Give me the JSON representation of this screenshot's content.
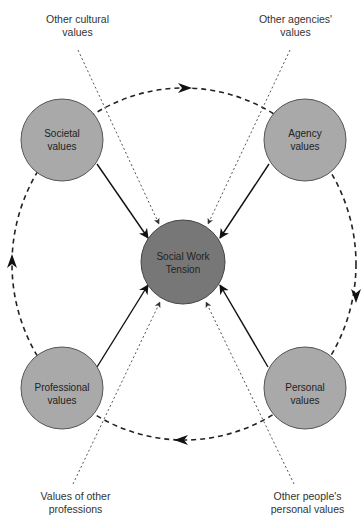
{
  "diagram": {
    "center_node": {
      "line1": "Social Work",
      "line2": "Tension",
      "fill": "#777777"
    },
    "nodes": [
      {
        "id": "societal",
        "line1": "Societal",
        "line2": "values",
        "fill": "#a9a9a9"
      },
      {
        "id": "agency",
        "line1": "Agency",
        "line2": "values",
        "fill": "#a9a9a9"
      },
      {
        "id": "professional",
        "line1": "Professional",
        "line2": "values",
        "fill": "#a9a9a9"
      },
      {
        "id": "personal",
        "line1": "Personal",
        "line2": "values",
        "fill": "#a9a9a9"
      }
    ],
    "external_influences": [
      {
        "id": "other-cultural",
        "line1": "Other cultural",
        "line2": "values"
      },
      {
        "id": "other-agencies",
        "line1": "Other agencies'",
        "line2": "values"
      },
      {
        "id": "other-professions",
        "line1": "Values of other",
        "line2": "professions"
      },
      {
        "id": "other-people",
        "line1": "Other people's",
        "line2": "personal values"
      }
    ],
    "cycle_direction": "clockwise"
  }
}
